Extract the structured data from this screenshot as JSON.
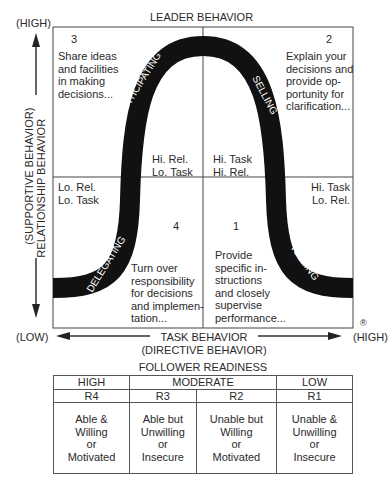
{
  "title": "LEADER BEHAVIOR",
  "y_axis": {
    "high": "(HIGH)",
    "low": "(LOW)",
    "label1": "(SUPPORTIVE BEHAVIOR)",
    "label2": "RELATIONSHIP BEHAVIOR"
  },
  "x_axis": {
    "low": "(LOW)",
    "high": "(HIGH)",
    "label1": "TASK BEHAVIOR",
    "label2": "(DIRECTIVE BEHAVIOR)"
  },
  "registered": "®",
  "quadrants": {
    "q3": {
      "num": "3",
      "lines": [
        "Share ideas",
        "and facilities",
        "in making",
        "decisions..."
      ],
      "style": "PARTICIPATING",
      "corner": [
        "Hi. Rel.",
        "Lo. Task"
      ]
    },
    "q2": {
      "num": "2",
      "lines": [
        "Explain your",
        "decisions and",
        "provide op-",
        "portunity for",
        "clarification..."
      ],
      "style": "SELLING",
      "corner": [
        "Hi. Task",
        "Hi. Rel."
      ]
    },
    "q4": {
      "num": "4",
      "lines": [
        "Turn over",
        "responsibility",
        "for decisions",
        "and implemen-",
        "tation..."
      ],
      "style": "DELEGATING",
      "corner": [
        "Lo. Rel.",
        "Lo. Task"
      ]
    },
    "q1": {
      "num": "1",
      "lines": [
        "Provide",
        "specific in-",
        "structions",
        "and closely",
        "supervise",
        "performance..."
      ],
      "style": "TELLING",
      "corner": [
        "Hi. Task",
        "Lo. Rel."
      ]
    }
  },
  "follower": {
    "title": "FOLLOWER READINESS",
    "levels": [
      "HIGH",
      "MODERATE",
      "LOW"
    ],
    "codes": [
      "R4",
      "R3",
      "R2",
      "R1"
    ],
    "desc": [
      [
        "Able &",
        "Willing",
        "or",
        "Motivated"
      ],
      [
        "Able but",
        "Unwilling",
        "or",
        "Insecure"
      ],
      [
        "Unable but",
        "Willing",
        "or",
        "Motivated"
      ],
      [
        "Unable &",
        "Unwilling",
        "or",
        "Insecure"
      ]
    ]
  }
}
